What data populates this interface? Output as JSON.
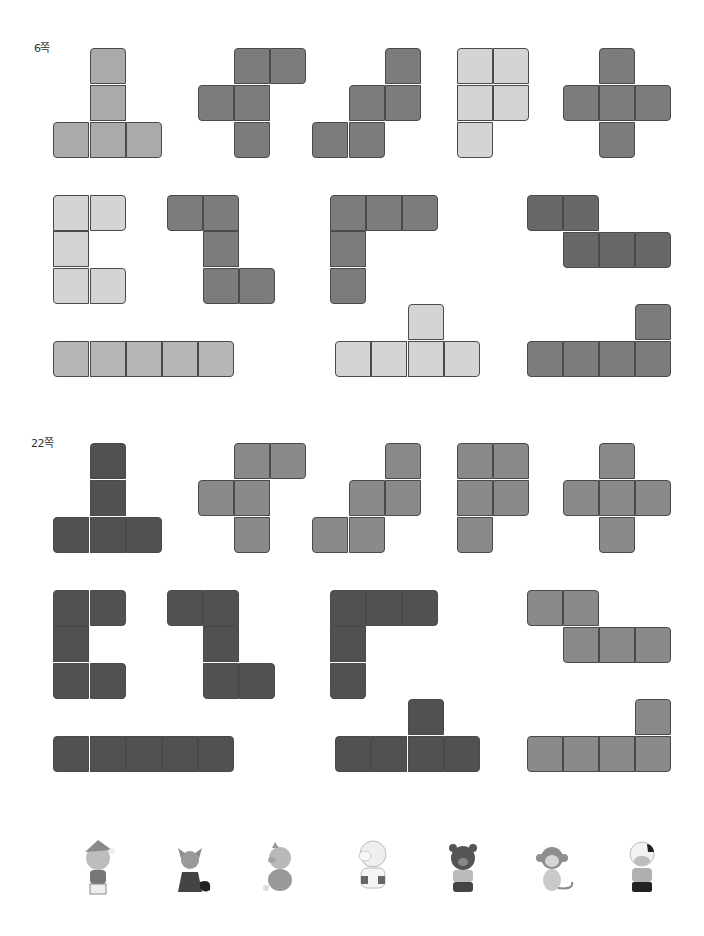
{
  "cell_size": 36,
  "colors": {
    "light": "#d2d2d2",
    "lightmid": "#b6b6b6",
    "mid": "#a9a9a9",
    "medium": "#888888",
    "darkmid": "#7a7a7a",
    "dark": "#6a6a6a",
    "darkest": "#505050"
  },
  "sections": [
    {
      "label": "6쪽",
      "label_pos": [
        34,
        47
      ],
      "pieces": [
        {
          "name": "t-pentomino",
          "color": "#aaaaaa",
          "cells": [
            [
              90,
              48
            ],
            [
              90,
              85
            ],
            [
              53,
              122
            ],
            [
              90,
              122
            ],
            [
              126,
              122
            ]
          ]
        },
        {
          "name": "f-pentomino",
          "color": "#7c7c7c",
          "cells": [
            [
              234,
              48
            ],
            [
              270,
              48
            ],
            [
              198,
              85
            ],
            [
              234,
              85
            ],
            [
              234,
              122
            ]
          ]
        },
        {
          "name": "w-pentomino",
          "color": "#7c7c7c",
          "cells": [
            [
              385,
              48
            ],
            [
              349,
              85
            ],
            [
              385,
              85
            ],
            [
              312,
              122
            ],
            [
              349,
              122
            ]
          ]
        },
        {
          "name": "p-pentomino",
          "color": "#d4d4d4",
          "cells": [
            [
              457,
              48
            ],
            [
              493,
              48
            ],
            [
              457,
              85
            ],
            [
              493,
              85
            ],
            [
              457,
              122
            ]
          ]
        },
        {
          "name": "x-pentomino",
          "color": "#7c7c7c",
          "cells": [
            [
              599,
              48
            ],
            [
              563,
              85
            ],
            [
              599,
              85
            ],
            [
              635,
              85
            ],
            [
              599,
              122
            ]
          ]
        },
        {
          "name": "u-pentomino",
          "color": "#d4d4d4",
          "cells": [
            [
              53,
              195
            ],
            [
              90,
              195
            ],
            [
              53,
              231
            ],
            [
              53,
              268
            ],
            [
              90,
              268
            ]
          ]
        },
        {
          "name": "z-pentomino",
          "color": "#7c7c7c",
          "cells": [
            [
              167,
              195
            ],
            [
              203,
              195
            ],
            [
              203,
              231
            ],
            [
              203,
              268
            ],
            [
              239,
              268
            ]
          ]
        },
        {
          "name": "v-pentomino",
          "color": "#7c7c7c",
          "cells": [
            [
              330,
              195
            ],
            [
              366,
              195
            ],
            [
              402,
              195
            ],
            [
              330,
              231
            ],
            [
              330,
              268
            ]
          ]
        },
        {
          "name": "n-pentomino",
          "color": "#686868",
          "cells": [
            [
              527,
              195
            ],
            [
              563,
              195
            ],
            [
              563,
              232
            ],
            [
              599,
              232
            ],
            [
              635,
              232
            ]
          ]
        },
        {
          "name": "i-pentomino",
          "color": "#b6b6b6",
          "cells": [
            [
              53,
              341
            ],
            [
              90,
              341
            ],
            [
              126,
              341
            ],
            [
              162,
              341
            ],
            [
              198,
              341
            ]
          ]
        },
        {
          "name": "y-pentomino",
          "color": "#d4d4d4",
          "cells": [
            [
              408,
              304
            ],
            [
              335,
              341
            ],
            [
              371,
              341
            ],
            [
              408,
              341
            ],
            [
              444,
              341
            ]
          ]
        },
        {
          "name": "l-pentomino",
          "color": "#7c7c7c",
          "cells": [
            [
              635,
              304
            ],
            [
              527,
              341
            ],
            [
              563,
              341
            ],
            [
              599,
              341
            ],
            [
              635,
              341
            ]
          ]
        }
      ]
    },
    {
      "label": "22쪽",
      "label_pos": [
        31,
        442
      ],
      "pieces": [
        {
          "name": "t-pentomino",
          "color": "#515151",
          "cells": [
            [
              90,
              443
            ],
            [
              90,
              480
            ],
            [
              53,
              517
            ],
            [
              90,
              517
            ],
            [
              126,
              517
            ]
          ]
        },
        {
          "name": "f-pentomino",
          "color": "#8a8a8a",
          "cells": [
            [
              234,
              443
            ],
            [
              270,
              443
            ],
            [
              198,
              480
            ],
            [
              234,
              480
            ],
            [
              234,
              517
            ]
          ]
        },
        {
          "name": "w-pentomino",
          "color": "#8a8a8a",
          "cells": [
            [
              385,
              443
            ],
            [
              349,
              480
            ],
            [
              385,
              480
            ],
            [
              312,
              517
            ],
            [
              349,
              517
            ]
          ]
        },
        {
          "name": "p-pentomino",
          "color": "#8a8a8a",
          "cells": [
            [
              457,
              443
            ],
            [
              493,
              443
            ],
            [
              457,
              480
            ],
            [
              493,
              480
            ],
            [
              457,
              517
            ]
          ]
        },
        {
          "name": "x-pentomino",
          "color": "#8a8a8a",
          "cells": [
            [
              599,
              443
            ],
            [
              563,
              480
            ],
            [
              599,
              480
            ],
            [
              635,
              480
            ],
            [
              599,
              517
            ]
          ]
        },
        {
          "name": "u-pentomino",
          "color": "#515151",
          "cells": [
            [
              53,
              590
            ],
            [
              90,
              590
            ],
            [
              53,
              626
            ],
            [
              53,
              663
            ],
            [
              90,
              663
            ]
          ]
        },
        {
          "name": "z-pentomino",
          "color": "#515151",
          "cells": [
            [
              167,
              590
            ],
            [
              203,
              590
            ],
            [
              203,
              626
            ],
            [
              203,
              663
            ],
            [
              239,
              663
            ]
          ]
        },
        {
          "name": "v-pentomino",
          "color": "#515151",
          "cells": [
            [
              330,
              590
            ],
            [
              366,
              590
            ],
            [
              402,
              590
            ],
            [
              330,
              626
            ],
            [
              330,
              663
            ]
          ]
        },
        {
          "name": "n-pentomino",
          "color": "#8a8a8a",
          "cells": [
            [
              527,
              590
            ],
            [
              563,
              590
            ],
            [
              563,
              627
            ],
            [
              599,
              627
            ],
            [
              635,
              627
            ]
          ]
        },
        {
          "name": "i-pentomino",
          "color": "#515151",
          "cells": [
            [
              53,
              736
            ],
            [
              90,
              736
            ],
            [
              126,
              736
            ],
            [
              162,
              736
            ],
            [
              198,
              736
            ]
          ]
        },
        {
          "name": "y-pentomino",
          "color": "#515151",
          "cells": [
            [
              408,
              699
            ],
            [
              335,
              736
            ],
            [
              371,
              736
            ],
            [
              408,
              736
            ],
            [
              444,
              736
            ]
          ]
        },
        {
          "name": "l-pentomino",
          "color": "#8a8a8a",
          "cells": [
            [
              635,
              699
            ],
            [
              527,
              736
            ],
            [
              563,
              736
            ],
            [
              599,
              736
            ],
            [
              635,
              736
            ]
          ]
        }
      ]
    }
  ],
  "animals": [
    {
      "name": "cat",
      "x": 68,
      "y": 838
    },
    {
      "name": "fox",
      "x": 160,
      "y": 838
    },
    {
      "name": "pig",
      "x": 250,
      "y": 838
    },
    {
      "name": "sheep",
      "x": 343,
      "y": 836
    },
    {
      "name": "bear",
      "x": 433,
      "y": 838
    },
    {
      "name": "monkey",
      "x": 522,
      "y": 838
    },
    {
      "name": "cow",
      "x": 612,
      "y": 836
    }
  ]
}
